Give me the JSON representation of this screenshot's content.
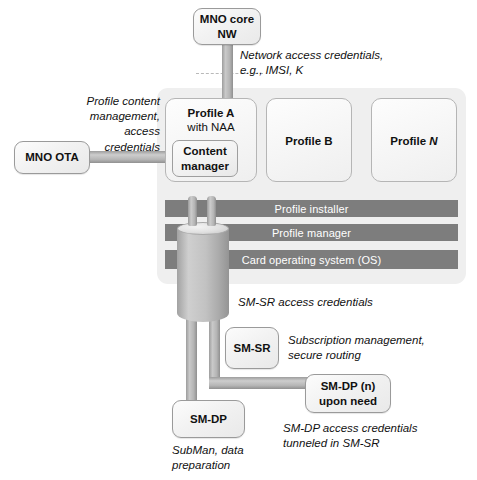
{
  "diagram": {
    "colors": {
      "panel_bg": "#efefef",
      "layer_bar": "#7d7d7d",
      "layer_text": "#ffffff",
      "pipe": "#b4b4b4",
      "node_border": "#9a9a9a"
    }
  },
  "nodes": {
    "mno_core_nw": {
      "line1": "MNO core",
      "line2": "NW"
    },
    "mno_ota": {
      "label": "MNO OTA"
    },
    "content_manager": {
      "line1": "Content",
      "line2": "manager"
    },
    "sm_sr": {
      "label": "SM-SR"
    },
    "sm_dp": {
      "label": "SM-DP"
    },
    "sm_dp_n": {
      "line1": "SM-DP (n)",
      "line2": "upon need"
    }
  },
  "profiles": [
    {
      "title": "Profile A",
      "subtitle": "with NAA",
      "italic_suffix": ""
    },
    {
      "title": "Profile B",
      "subtitle": "",
      "italic_suffix": ""
    },
    {
      "title": "Profile ",
      "subtitle": "",
      "italic_suffix": "N"
    }
  ],
  "layers": [
    {
      "label": "Profile installer"
    },
    {
      "label": "Profile manager"
    },
    {
      "label": "Card operating system (OS)"
    }
  ],
  "notes": {
    "network_access": "Network access credentials, e.g., IMSI, K",
    "profile_content": "Profile content management, access credentials",
    "sm_sr_access": "SM-SR access credentials",
    "subscription_mgmt": "Subscription management, secure routing",
    "sm_dp_access": "SM-DP access credentials tunneled in SM-SR",
    "subman": "SubMan, data preparation"
  }
}
